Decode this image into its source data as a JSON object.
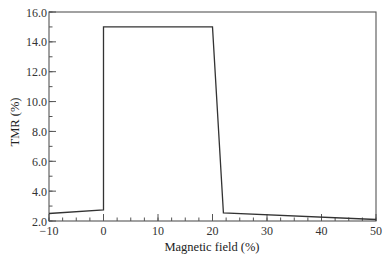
{
  "chart_data": {
    "type": "line",
    "title": "",
    "xlabel": "Magnetic field (%)",
    "ylabel": "TMR (%)",
    "xlim": [
      -10,
      50
    ],
    "ylim": [
      2.0,
      16.0
    ],
    "x_ticks": [
      -10,
      0,
      10,
      20,
      30,
      40,
      50
    ],
    "x_tick_labels": [
      "−10",
      "0",
      "10",
      "20",
      "30",
      "40",
      "50"
    ],
    "y_ticks": [
      2.0,
      4.0,
      6.0,
      8.0,
      10.0,
      12.0,
      14.0,
      16.0
    ],
    "y_tick_labels": [
      "2.0",
      "4.0",
      "6.0",
      "8.0",
      "10.0",
      "12.0",
      "14.0",
      "16.0"
    ],
    "x_minor_step": 2.5,
    "y_minor_step": 1.0,
    "grid": false,
    "legend": null,
    "series": [
      {
        "name": "TMR",
        "color": "#333333",
        "x": [
          -10,
          0,
          0,
          20,
          22,
          50
        ],
        "y": [
          2.5,
          2.75,
          15.0,
          15.0,
          2.55,
          2.1
        ]
      }
    ]
  }
}
